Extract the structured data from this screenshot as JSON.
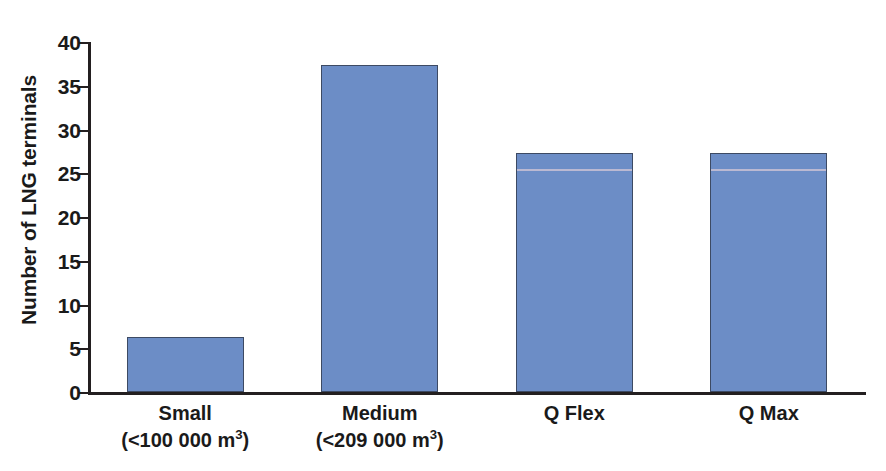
{
  "chart_data": {
    "type": "bar",
    "title": "",
    "xlabel": "",
    "ylabel": "Number of LNG terminals",
    "categories": [
      "Small",
      "Medium",
      "Q Flex",
      "Q Max"
    ],
    "category_sublabels": [
      "(<100 000 m3)",
      "(<209 000 m3)",
      "",
      ""
    ],
    "values": [
      6,
      37,
      27,
      27
    ],
    "ylim": [
      0,
      40
    ],
    "yticks": [
      0,
      5,
      10,
      15,
      20,
      25,
      30,
      35,
      40
    ],
    "ytick_labels": [
      "0",
      "5",
      "10",
      "15",
      "20",
      "25",
      "30",
      "35",
      "40"
    ],
    "grid": false,
    "legend": false,
    "bar_color": "#6c8dc6",
    "bar_edge_color": "#3d4a63",
    "axis_color": "#231f20",
    "background": "#ffffff"
  },
  "axis": {
    "y_title": "Number of LNG terminals"
  },
  "categories": [
    {
      "name": "Small",
      "sub_prefix": "(<100 000 m",
      "sub_exponent": "3",
      "sub_suffix": ")",
      "value": 6
    },
    {
      "name": "Medium",
      "sub_prefix": "(<209 000 m",
      "sub_exponent": "3",
      "sub_suffix": ")",
      "value": 37
    },
    {
      "name": "Q Flex",
      "sub_prefix": "",
      "sub_exponent": "",
      "sub_suffix": "",
      "value": 27
    },
    {
      "name": "Q Max",
      "sub_prefix": "",
      "sub_exponent": "",
      "sub_suffix": "",
      "value": 27
    }
  ]
}
